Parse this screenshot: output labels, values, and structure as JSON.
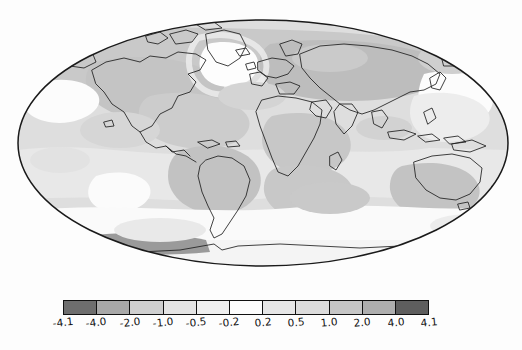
{
  "figure": {
    "type": "map-with-colorbar",
    "projection": "mollweide",
    "title": "",
    "background_color": "#ffffff",
    "outline_color": "#1a1a1a",
    "coastline_color": "#1f1f1f"
  },
  "chart_data": {
    "type": "heatmap",
    "title": "",
    "subtitle": "",
    "xlabel": "",
    "ylabel": "",
    "projection": "mollweide",
    "grid": false,
    "legend_position": "bottom",
    "colorbar": {
      "orientation": "horizontal",
      "n_cells": 11,
      "boundaries": [
        -4.1,
        -4.0,
        -2.0,
        -1.0,
        -0.5,
        -0.2,
        0.2,
        0.5,
        1.0,
        2.0,
        4.0,
        4.1
      ],
      "tick_labels": [
        "-4.1",
        "-4.0",
        "-2.0",
        "-1.0",
        "-0.5",
        "-0.2",
        "0.2",
        "0.5",
        "1.0",
        "2.0",
        "4.0",
        "4.1"
      ],
      "cell_colors": [
        "#6e6e6e",
        "#a8a8a8",
        "#cfcfcf",
        "#e4e4e4",
        "#efefef",
        "#fdfdfd",
        "#e6e6e6",
        "#dcdcdc",
        "#c6c6c6",
        "#aeaeae",
        "#5e5e5e"
      ],
      "cell_ranges": [
        "-4.1 to -4.0",
        "-4.0 to -2.0",
        "-2.0 to -1.0",
        "-1.0 to -0.5",
        "-0.5 to -0.2",
        "-0.2 to 0.2",
        "0.2 to 0.5",
        "0.5 to 1.0",
        "1.0 to 2.0",
        "2.0 to 4.0",
        "4.0 to 4.1"
      ],
      "vmin": -4.1,
      "vmax": 4.1
    },
    "field_description": "global gridded anomaly field shaded in discrete grayscale contour bands",
    "shaded_regions": [
      {
        "name": "north-pacific-positive",
        "level": "1.0 to 2.0"
      },
      {
        "name": "greenland-negative",
        "level": "-0.5 to -0.2"
      },
      {
        "name": "north-america-positive",
        "level": "0.5 to 1.0"
      },
      {
        "name": "siberia-positive",
        "level": "1.0 to 2.0"
      },
      {
        "name": "south-america-positive",
        "level": "1.0 to 2.0"
      },
      {
        "name": "southern-ocean-negative",
        "level": "-0.2 to 0.2"
      },
      {
        "name": "antarctic-peninsula-strong-positive",
        "level": "2.0 to 4.0"
      },
      {
        "name": "australia-positive",
        "level": "0.5 to 1.0"
      },
      {
        "name": "indian-ocean-positive",
        "level": "0.5 to 1.0"
      },
      {
        "name": "africa-positive",
        "level": "0.5 to 1.0"
      }
    ]
  }
}
